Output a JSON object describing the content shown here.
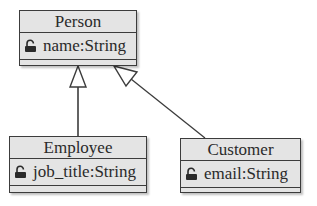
{
  "diagram": {
    "type": "uml-class-diagram",
    "classes": [
      {
        "id": "person",
        "name": "Person",
        "attributes": [
          {
            "icon": "lock-icon",
            "text": "name:String"
          }
        ]
      },
      {
        "id": "employee",
        "name": "Employee",
        "attributes": [
          {
            "icon": "lock-icon",
            "text": "job_title:String"
          }
        ]
      },
      {
        "id": "customer",
        "name": "Customer",
        "attributes": [
          {
            "icon": "lock-icon",
            "text": "email:String"
          }
        ]
      }
    ],
    "relations": [
      {
        "type": "generalization",
        "from": "Employee",
        "to": "Person"
      },
      {
        "type": "generalization",
        "from": "Customer",
        "to": "Person"
      }
    ],
    "colors": {
      "box_fill": "#e4e4e4",
      "border": "#3c3c3c",
      "text": "#2a2a2a"
    }
  }
}
